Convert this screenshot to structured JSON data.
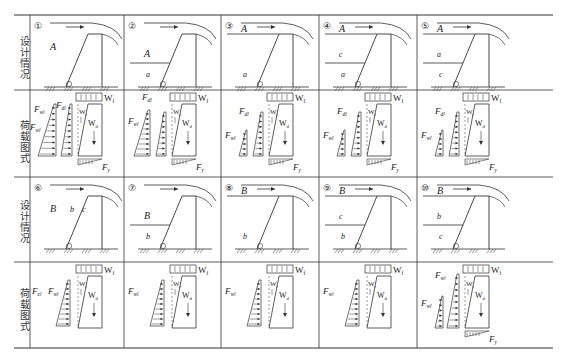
{
  "row_labels": {
    "design": "设计情况",
    "load": "荷载图式"
  },
  "cases": [
    {
      "num": "①",
      "zone_labels": [
        {
          "t": "A",
          "pos": "mid"
        }
      ],
      "berm": null,
      "top_label": null,
      "loads": {
        "Fwl": "F_wl",
        "Fdl": "F_dl",
        "show_fdl_tri": true,
        "show_fwl": true,
        "Fy": true,
        "Fel": null
      }
    },
    {
      "num": "②",
      "zone_labels": [
        {
          "t": "A",
          "pos": "upper"
        },
        {
          "t": "a",
          "pos": "lower"
        }
      ],
      "berm": "mid",
      "top_label": null,
      "loads": {
        "Fwl": "F_wl",
        "Fdl": "F_dl",
        "Fy": true
      }
    },
    {
      "num": "③",
      "zone_labels": [
        {
          "t": "a",
          "pos": "lower"
        }
      ],
      "berm": null,
      "top_label": "A",
      "loads": {
        "Fwl": "F_wl",
        "Fdl": "F_dl",
        "Fy": true
      }
    },
    {
      "num": "④",
      "zone_labels": [
        {
          "t": "c",
          "pos": "upper"
        },
        {
          "t": "a",
          "pos": "lower"
        }
      ],
      "berm": "mid",
      "top_label": "A",
      "loads": {
        "Fwl": "F_wl",
        "Fdl": "F_dl",
        "Fy": true
      }
    },
    {
      "num": "⑤",
      "zone_labels": [
        {
          "t": "a",
          "pos": "upper"
        },
        {
          "t": "c",
          "pos": "lower"
        }
      ],
      "berm": "mid",
      "top_label": "A",
      "loads": {
        "Fwl": "F_wl",
        "Fdl": "F_dl",
        "Fy": true
      }
    },
    {
      "num": "⑥",
      "zone_labels": [
        {
          "t": "B",
          "pos": "mid"
        },
        {
          "t": "b",
          "pos": "mid2"
        },
        {
          "t": "c",
          "pos": "mid3"
        }
      ],
      "berm": null,
      "top_label": null,
      "loads": {
        "Fel": "F_el",
        "Fwl": "F_wl",
        "Fy": false
      }
    },
    {
      "num": "⑦",
      "zone_labels": [
        {
          "t": "B",
          "pos": "upper"
        },
        {
          "t": "b",
          "pos": "lower"
        }
      ],
      "berm": "mid",
      "top_label": null,
      "loads": {
        "Fwl": "F_wl",
        "Fy": false
      }
    },
    {
      "num": "⑧",
      "zone_labels": [
        {
          "t": "b",
          "pos": "lower"
        }
      ],
      "berm": null,
      "top_label": "B",
      "loads": {
        "Fwl": "F_wl",
        "Fy": false
      }
    },
    {
      "num": "⑨",
      "zone_labels": [
        {
          "t": "c",
          "pos": "upper"
        },
        {
          "t": "b",
          "pos": "lower"
        }
      ],
      "berm": "mid",
      "top_label": "B",
      "loads": {
        "Fwl": "F_wl",
        "Fy": false
      }
    },
    {
      "num": "⑩",
      "zone_labels": [
        {
          "t": "b",
          "pos": "upper"
        },
        {
          "t": "c",
          "pos": "lower"
        }
      ],
      "berm": "mid",
      "top_label": "B",
      "loads": {
        "Fwl": "F_wl",
        "Fdl": "F_wl",
        "Fy": true
      }
    }
  ],
  "load_symbols": {
    "Wf": "W",
    "Wf_sub": "f",
    "Wr": "W",
    "Wr_sub": "r",
    "Wd": "W",
    "Wd_sub": "d",
    "Fy": "F",
    "Fy_sub": "y",
    "F": "F",
    "wl": "wl",
    "dl": "dl",
    "el": "el"
  }
}
